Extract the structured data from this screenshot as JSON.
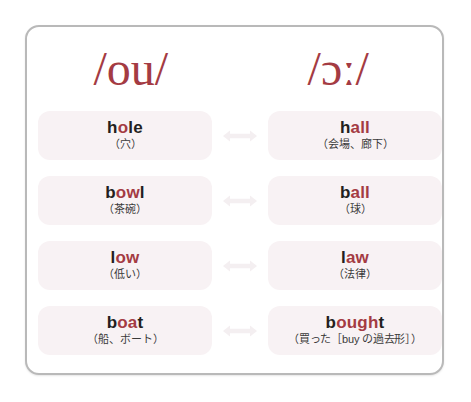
{
  "card": {
    "border_color": "#b9b9b9",
    "background": "#ffffff"
  },
  "colors": {
    "accent_red": "#a43b43",
    "word_dark": "#231f20",
    "pill_background": "#f8f2f4",
    "arrow": "#f4eff1"
  },
  "phonetics": {
    "left": "/ou/",
    "right": "/ɔː/"
  },
  "arrow_icon": "double-headed-arrow",
  "rows": [
    {
      "left": {
        "word_pre": "h",
        "word_hl": "o",
        "word_post": "le",
        "word_full": "hole",
        "gloss": "（穴）"
      },
      "arrow": "↔",
      "right": {
        "word_pre": "h",
        "word_hl": "all",
        "word_post": "",
        "word_full": "hall",
        "gloss": "（会場、廊下）"
      }
    },
    {
      "left": {
        "word_pre": "b",
        "word_hl": "ow",
        "word_post": "l",
        "word_full": "bowl",
        "gloss": "（茶碗）"
      },
      "arrow": "↔",
      "right": {
        "word_pre": "b",
        "word_hl": "all",
        "word_post": "",
        "word_full": "ball",
        "gloss": "（球）"
      }
    },
    {
      "left": {
        "word_pre": "l",
        "word_hl": "ow",
        "word_post": "",
        "word_full": "low",
        "gloss": "（低い）"
      },
      "arrow": "↔",
      "right": {
        "word_pre": "l",
        "word_hl": "aw",
        "word_post": "",
        "word_full": "law",
        "gloss": "（法律）"
      }
    },
    {
      "left": {
        "word_pre": "b",
        "word_hl": "oa",
        "word_post": "t",
        "word_full": "boat",
        "gloss": "（船、ボート）"
      },
      "arrow": "↔",
      "right": {
        "word_pre": "b",
        "word_hl": "ough",
        "word_post": "t",
        "word_full": "bought",
        "gloss": "（買った［buy の過去形］）"
      }
    }
  ]
}
